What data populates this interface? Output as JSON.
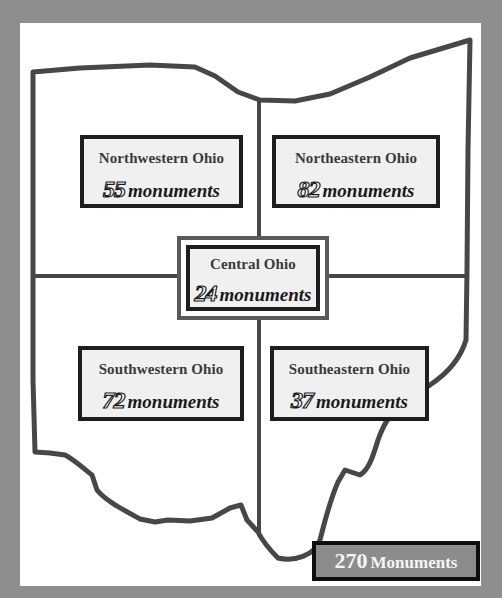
{
  "map": {
    "title": "Ohio monuments by region",
    "colors": {
      "background": "#8e8e8e",
      "panel": "#ffffff",
      "outline": "#4a4a4a",
      "box_fill": "#f0f0f0",
      "box_border": "#1e1e1e",
      "total_fill": "#8c8c8c"
    },
    "regions": [
      {
        "id": "northwestern",
        "name": "Northwestern Ohio",
        "count": "55",
        "label": "monuments"
      },
      {
        "id": "northeastern",
        "name": "Northeastern Ohio",
        "count": "82",
        "label": "monuments"
      },
      {
        "id": "central",
        "name": "Central Ohio",
        "count": "24",
        "label": "monuments"
      },
      {
        "id": "southwestern",
        "name": "Southwestern Ohio",
        "count": "72",
        "label": "monuments"
      },
      {
        "id": "southeastern",
        "name": "Southeastern Ohio",
        "count": "37",
        "label": "monuments"
      }
    ],
    "total": {
      "count": "270",
      "label": "Monuments"
    }
  }
}
